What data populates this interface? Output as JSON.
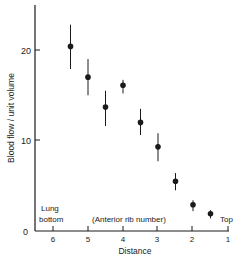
{
  "chart_data": {
    "type": "scatter",
    "title": "",
    "xlabel": "Distance",
    "ylabel": "Blood flow / unit volume",
    "xlim": [
      6.5,
      1
    ],
    "ylim": [
      0,
      25
    ],
    "x_ticks": [
      6,
      5,
      4,
      3,
      2,
      1
    ],
    "y_ticks": [
      0,
      10,
      20
    ],
    "grid": false,
    "legend": null,
    "annotations": [
      {
        "text": "Lung",
        "role": "lung-bottom-line1"
      },
      {
        "text": "bottom",
        "role": "lung-bottom-line2"
      },
      {
        "text": "(Anterior rib number)",
        "role": "axis-note"
      },
      {
        "text": "Top",
        "role": "lung-top"
      }
    ],
    "series": [
      {
        "name": "Blood flow",
        "points": [
          {
            "x": 5.5,
            "y": 20.4,
            "err_low": 17.9,
            "err_high": 22.8
          },
          {
            "x": 5.0,
            "y": 17.0,
            "err_low": 15.0,
            "err_high": 19.0
          },
          {
            "x": 4.5,
            "y": 13.7,
            "err_low": 11.6,
            "err_high": 15.5
          },
          {
            "x": 4.0,
            "y": 16.1,
            "err_low": 15.2,
            "err_high": 16.7
          },
          {
            "x": 3.5,
            "y": 12.0,
            "err_low": 10.6,
            "err_high": 13.5
          },
          {
            "x": 3.0,
            "y": 9.3,
            "err_low": 7.7,
            "err_high": 10.8
          },
          {
            "x": 2.5,
            "y": 5.5,
            "err_low": 4.5,
            "err_high": 6.4
          },
          {
            "x": 2.0,
            "y": 2.9,
            "err_low": 2.2,
            "err_high": 3.4
          },
          {
            "x": 1.5,
            "y": 1.9,
            "err_low": 1.4,
            "err_high": 2.3
          }
        ]
      }
    ]
  },
  "labels": {
    "xlabel": "Distance",
    "ylabel": "Blood flow / unit volume",
    "lung_line1": "Lung",
    "lung_line2": "bottom",
    "rib_note": "(Anterior rib number)",
    "top": "Top",
    "y0": "0",
    "y10": "10",
    "y20": "20",
    "x6": "6",
    "x5": "5",
    "x4": "4",
    "x3": "3",
    "x2": "2",
    "x1": "1"
  },
  "colors": {
    "ink": "#1a1a1a",
    "background": "#ffffff"
  }
}
